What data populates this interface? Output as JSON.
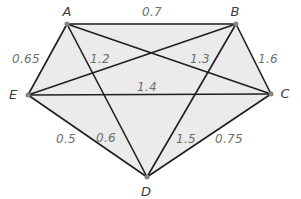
{
  "figure": {
    "type": "weighted-complete-graph",
    "width": 301,
    "height": 199,
    "colors": {
      "background": "#ffffff",
      "region_fill": "#ebebeb",
      "edge_stroke": "#1f1f1f",
      "vertex_dot": "#848484",
      "vertex_label": "#3c3c3c",
      "weight_label": "#6f6f6f"
    },
    "stroke_width": 1.6,
    "dot_radius": 2.5,
    "fill_polygon": [
      "A",
      "B",
      "C",
      "D",
      "E"
    ],
    "vertices": [
      {
        "id": "A",
        "x": 67,
        "y": 24,
        "label": "A",
        "label_x": 67,
        "label_y": 11
      },
      {
        "id": "B",
        "x": 236,
        "y": 24,
        "label": "B",
        "label_x": 235,
        "label_y": 11
      },
      {
        "id": "C",
        "x": 271,
        "y": 94,
        "label": "C",
        "label_x": 285,
        "label_y": 93
      },
      {
        "id": "D",
        "x": 147,
        "y": 177,
        "label": "D",
        "label_x": 146,
        "label_y": 191
      },
      {
        "id": "E",
        "x": 28,
        "y": 95,
        "label": "E",
        "label_x": 13,
        "label_y": 94
      }
    ],
    "edges": [
      {
        "from": "A",
        "to": "B",
        "weight": "0.7",
        "label_x": 152,
        "label_y": 12
      },
      {
        "from": "A",
        "to": "E",
        "weight": "0.65",
        "label_x": 26,
        "label_y": 59
      },
      {
        "from": "A",
        "to": "C",
        "weight": "1.3",
        "label_x": 200,
        "label_y": 59
      },
      {
        "from": "A",
        "to": "D",
        "weight": "0.6",
        "label_x": 106,
        "label_y": 138
      },
      {
        "from": "B",
        "to": "E",
        "weight": "1.2",
        "label_x": 100,
        "label_y": 59
      },
      {
        "from": "B",
        "to": "C",
        "weight": "1.6",
        "label_x": 268,
        "label_y": 59
      },
      {
        "from": "B",
        "to": "D",
        "weight": "1.5",
        "label_x": 186,
        "label_y": 139
      },
      {
        "from": "C",
        "to": "E",
        "weight": "1.4",
        "label_x": 147,
        "label_y": 87
      },
      {
        "from": "C",
        "to": "D",
        "weight": "0.75",
        "label_x": 229,
        "label_y": 139
      },
      {
        "from": "D",
        "to": "E",
        "weight": "0.5",
        "label_x": 66,
        "label_y": 139
      }
    ]
  }
}
